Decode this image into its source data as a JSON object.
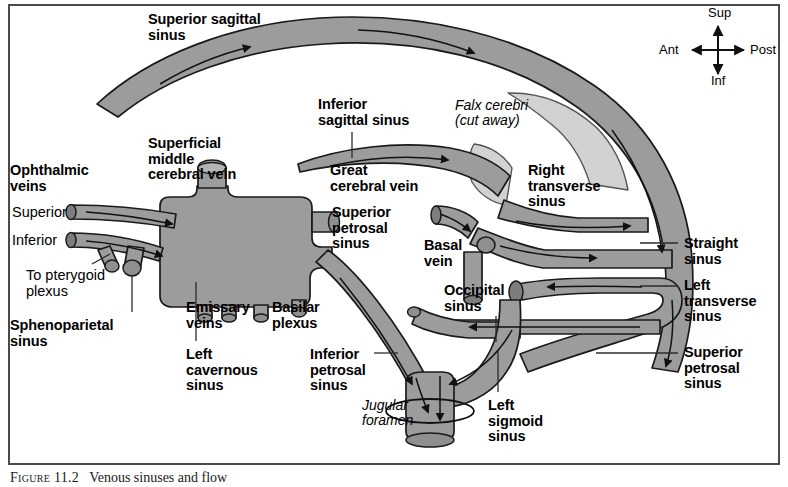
{
  "figure": {
    "caption_label": "Figure 11.2",
    "caption_text": "Venous sinuses and flow",
    "border_color": "#4a4a4a"
  },
  "colors": {
    "vessel_fill": "#9c9c9c",
    "vessel_stroke": "#1a1a1a",
    "falx_fill": "#d2d2d2",
    "background": "#ffffff",
    "text": "#000000",
    "leader_line": "#2b2b2b"
  },
  "compass": {
    "name": "orientation-compass",
    "up": "Sup",
    "down": "Inf",
    "left": "Ant",
    "right": "Post"
  },
  "labels": [
    {
      "id": "superior-sagittal-sinus",
      "text": "Superior sagittal\nsinus",
      "style": "bold",
      "x": 148,
      "y": 12
    },
    {
      "id": "inferior-sagittal-sinus",
      "text": "Inferior\nsagittal sinus",
      "style": "bold",
      "x": 318,
      "y": 97
    },
    {
      "id": "falx-cerebri",
      "text": "Falx cerebri\n(cut away)",
      "style": "ital",
      "x": 455,
      "y": 98
    },
    {
      "id": "superficial-middle-cerebral-vein",
      "text": "Superficial\nmiddle\ncerebral vein",
      "style": "bold",
      "x": 148,
      "y": 136
    },
    {
      "id": "ophthalmic-veins",
      "text": "Ophthalmic\nveins",
      "style": "bold",
      "x": 10,
      "y": 163
    },
    {
      "id": "ophthalmic-superior",
      "text": "Superior",
      "style": "reg",
      "x": 12,
      "y": 205
    },
    {
      "id": "ophthalmic-inferior",
      "text": "Inferior",
      "style": "reg",
      "x": 12,
      "y": 233
    },
    {
      "id": "great-cerebral-vein",
      "text": "Great\ncerebral vein",
      "style": "bold",
      "x": 330,
      "y": 163
    },
    {
      "id": "superior-petrosal-sinus-left",
      "text": "Superior\npetrosal\nsinus",
      "style": "bold",
      "x": 332,
      "y": 205
    },
    {
      "id": "right-transverse-sinus",
      "text": "Right\ntransverse\nsinus",
      "style": "bold",
      "x": 528,
      "y": 163
    },
    {
      "id": "basal-vein",
      "text": "Basal\nvein",
      "style": "bold",
      "x": 424,
      "y": 238
    },
    {
      "id": "straight-sinus",
      "text": "Straight\nsinus",
      "style": "bold",
      "x": 684,
      "y": 236
    },
    {
      "id": "left-transverse-sinus",
      "text": "Left\ntransverse\nsinus",
      "style": "bold",
      "x": 684,
      "y": 278
    },
    {
      "id": "to-pterygoid-plexus",
      "text": "To pterygoid\nplexus",
      "style": "reg",
      "x": 26,
      "y": 268
    },
    {
      "id": "occipital-sinus",
      "text": "Occipital\nsinus",
      "style": "bold",
      "x": 444,
      "y": 283
    },
    {
      "id": "emissary-veins",
      "text": "Emissary\nveins",
      "style": "bold",
      "x": 186,
      "y": 300
    },
    {
      "id": "basilar-plexus",
      "text": "Basilar\nplexus",
      "style": "bold",
      "x": 272,
      "y": 300
    },
    {
      "id": "sphenoparietal-sinus",
      "text": "Sphenoparietal\nsinus",
      "style": "bold",
      "x": 10,
      "y": 318
    },
    {
      "id": "left-cavernous-sinus",
      "text": "Left\ncavernous\nsinus",
      "style": "bold",
      "x": 186,
      "y": 347
    },
    {
      "id": "inferior-petrosal-sinus",
      "text": "Inferior\npetrosal\nsinus",
      "style": "bold",
      "x": 310,
      "y": 347
    },
    {
      "id": "superior-petrosal-sinus-right",
      "text": "Superior\npetrosal\nsinus",
      "style": "bold",
      "x": 684,
      "y": 345
    },
    {
      "id": "jugular-foramen",
      "text": "Jugular\nforamen",
      "style": "ital",
      "x": 362,
      "y": 398
    },
    {
      "id": "left-sigmoid-sinus",
      "text": "Left\nsigmoid\nsinus",
      "style": "bold",
      "x": 488,
      "y": 398
    }
  ],
  "structures": [
    {
      "id": "superior-sagittal-sinus-vessel",
      "name": "superior-sagittal-sinus-vessel"
    },
    {
      "id": "inferior-sagittal-sinus-vessel",
      "name": "inferior-sagittal-sinus-vessel"
    },
    {
      "id": "falx-cerebri-upper",
      "name": "falx-cerebri-upper-flap"
    },
    {
      "id": "falx-cerebri-lower",
      "name": "falx-cerebri-lower-flap"
    },
    {
      "id": "cavernous-sinus-body",
      "name": "left-cavernous-sinus-body"
    },
    {
      "id": "superficial-middle-cerebral-vein-tube",
      "name": "superficial-middle-cerebral-vein-tube"
    },
    {
      "id": "superior-ophthalmic-vein-tube",
      "name": "superior-ophthalmic-vein-tube"
    },
    {
      "id": "inferior-ophthalmic-vein-tube",
      "name": "inferior-ophthalmic-vein-tube"
    },
    {
      "id": "pterygoid-plexus-stub",
      "name": "pterygoid-plexus-stub"
    },
    {
      "id": "sphenoparietal-sinus-stub",
      "name": "sphenoparietal-sinus-stub"
    },
    {
      "id": "emissary-vein-stubs",
      "name": "emissary-vein-stubs"
    },
    {
      "id": "basilar-plexus-stub",
      "name": "basilar-plexus-stub"
    },
    {
      "id": "inferior-petrosal-sinus-tube",
      "name": "inferior-petrosal-sinus-tube"
    },
    {
      "id": "great-cerebral-vein-tube",
      "name": "great-cerebral-vein-tube"
    },
    {
      "id": "basal-vein-tube",
      "name": "basal-vein-tube"
    },
    {
      "id": "straight-sinus-vessel",
      "name": "straight-sinus-vessel"
    },
    {
      "id": "right-transverse-sinus-vessel",
      "name": "right-transverse-sinus-vessel"
    },
    {
      "id": "left-transverse-sinus-vessel",
      "name": "left-transverse-sinus-vessel"
    },
    {
      "id": "superior-petrosal-sinus-vessel",
      "name": "superior-petrosal-sinus-vessel"
    },
    {
      "id": "occipital-sinus-vessel",
      "name": "occipital-sinus-vessel"
    },
    {
      "id": "left-sigmoid-sinus-vessel",
      "name": "left-sigmoid-sinus-vessel"
    },
    {
      "id": "jugular-foramen-ring",
      "name": "jugular-foramen-ring"
    }
  ]
}
